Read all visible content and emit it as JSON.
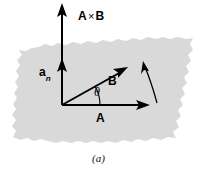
{
  "figure": {
    "caption": "(a)",
    "plane": {
      "name": "shaded-plane",
      "fill_color": "#d9d9d9",
      "description": "ragged-edged shaded parallelogram representing the plane containing A and B"
    },
    "labels": {
      "cross_product": {
        "vector_a": "A",
        "operator": "×",
        "vector_b": "B"
      },
      "normal_unit_vector": {
        "base": "a",
        "subscript": "n"
      },
      "vector_b": "B",
      "vector_a": "A",
      "angle": "θ"
    },
    "colors": {
      "stroke": "#000000",
      "plane_fill": "#d9d9d9",
      "background": "#ffffff",
      "text": "#000000"
    },
    "elements": {
      "axis_vertical_name": "A x B axis arrow",
      "normal_arrow_name": "a_n unit normal arrow",
      "vector_a_name": "vector A arrow",
      "vector_b_name": "vector B arrow",
      "angle_arc_name": "theta angle arc",
      "rotation_arrow_name": "right-hand rotation curved arrow"
    }
  }
}
